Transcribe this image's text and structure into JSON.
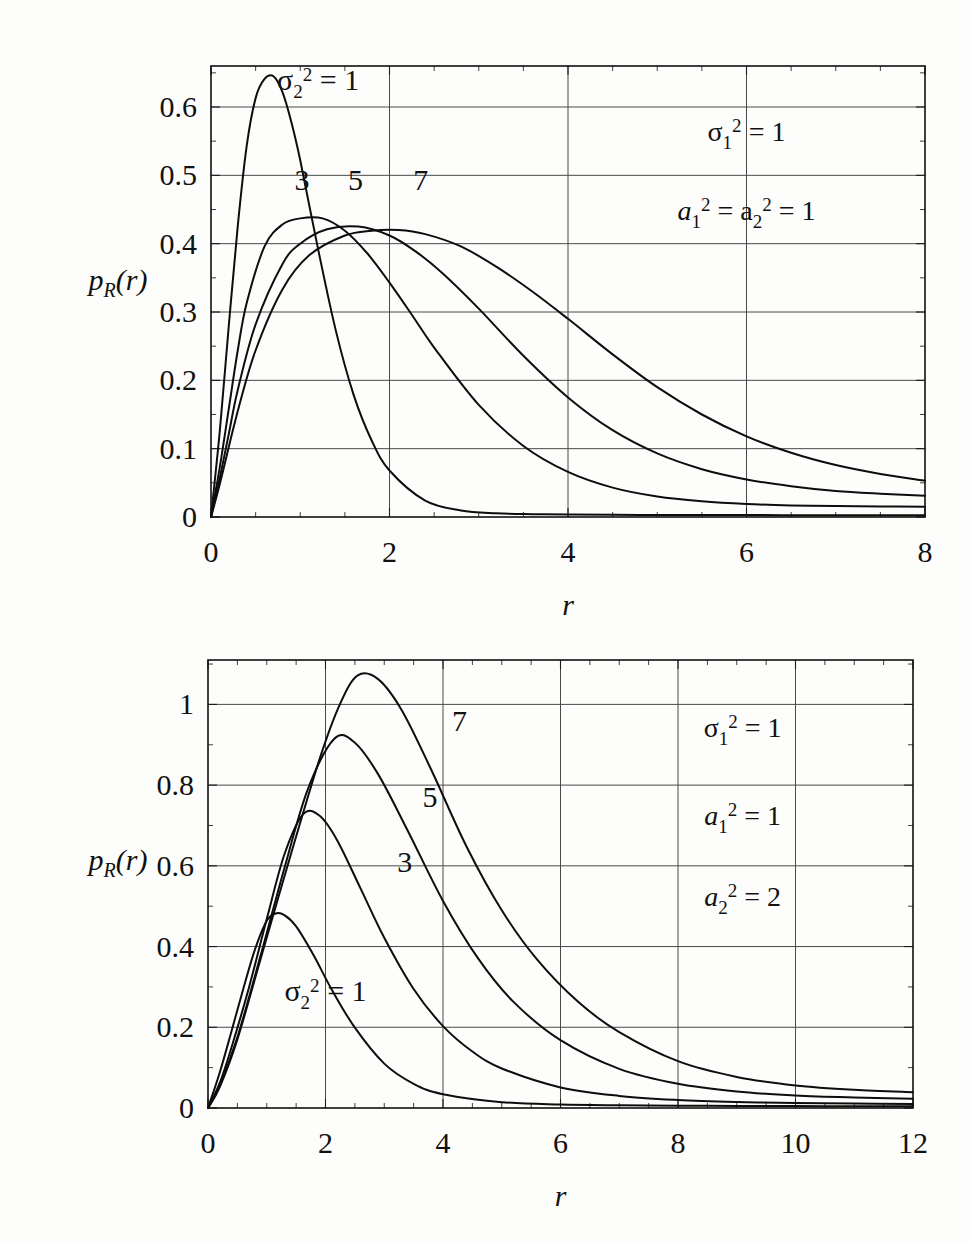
{
  "chart_data": [
    {
      "type": "line",
      "id": "top-chart",
      "title": "",
      "xlabel": "r",
      "ylabel": "p_R(r)",
      "xlim": [
        0,
        8
      ],
      "ylim": [
        0,
        0.66
      ],
      "xticks": [
        0,
        2,
        4,
        6,
        8
      ],
      "xticklabels": [
        "0",
        "2",
        "4",
        "6",
        "8"
      ],
      "yticks": [
        0,
        0.1,
        0.2,
        0.3,
        0.4,
        0.5,
        0.6
      ],
      "yticklabels": [
        "0",
        "0.1",
        "0.2",
        "0.3",
        "0.4",
        "0.5",
        "0.6"
      ],
      "x_minor_step": 0.5,
      "y_minor_step": 0.05,
      "grid": true,
      "legend_position": "inline-curve-labels",
      "annotations": [
        {
          "id": "sigma1",
          "text": "σ₁² = 1",
          "x": 6.0,
          "y": 0.55
        },
        {
          "id": "a1a2",
          "text": "a₁² = a₂² = 1",
          "x": 6.0,
          "y": 0.435
        }
      ],
      "series": [
        {
          "name": "σ₂² = 1",
          "label": "σ₂² = 1",
          "label_x": 1.2,
          "label_y": 0.625,
          "peak_x": 0.7,
          "peak_y": 0.645,
          "x": [
            0,
            0.1,
            0.2,
            0.3,
            0.4,
            0.5,
            0.6,
            0.7,
            0.8,
            0.9,
            1.0,
            1.2,
            1.4,
            1.6,
            1.8,
            2.0,
            2.4,
            2.8,
            3.2,
            3.6,
            4.0,
            4.8,
            5.6,
            6.4,
            7.2,
            8.0
          ],
          "y": [
            0.0,
            0.128,
            0.281,
            0.426,
            0.543,
            0.613,
            0.641,
            0.645,
            0.622,
            0.578,
            0.522,
            0.392,
            0.272,
            0.178,
            0.112,
            0.068,
            0.024,
            0.0095,
            0.0055,
            0.0042,
            0.0036,
            0.0031,
            0.0029,
            0.0027,
            0.0026,
            0.0025
          ]
        },
        {
          "name": "3",
          "label": "3",
          "label_x": 1.02,
          "label_y": 0.478,
          "peak_x": 1.25,
          "peak_y": 0.437,
          "x": [
            0,
            0.1,
            0.2,
            0.3,
            0.4,
            0.6,
            0.8,
            1.0,
            1.25,
            1.5,
            1.75,
            2.0,
            2.25,
            2.5,
            3.0,
            3.5,
            4.0,
            4.5,
            5.0,
            5.5,
            6.0,
            6.5,
            7.0,
            7.5,
            8.0
          ],
          "y": [
            0.0,
            0.074,
            0.159,
            0.244,
            0.313,
            0.396,
            0.428,
            0.437,
            0.437,
            0.419,
            0.386,
            0.343,
            0.296,
            0.248,
            0.164,
            0.104,
            0.066,
            0.043,
            0.03,
            0.023,
            0.019,
            0.017,
            0.016,
            0.0155,
            0.015
          ]
        },
        {
          "name": "5",
          "label": "5",
          "label_x": 1.62,
          "label_y": 0.478,
          "peak_x": 1.65,
          "peak_y": 0.425,
          "x": [
            0,
            0.1,
            0.2,
            0.3,
            0.5,
            0.8,
            1.0,
            1.3,
            1.65,
            2.0,
            2.3,
            2.6,
            3.0,
            3.5,
            4.0,
            4.5,
            5.0,
            5.5,
            6.0,
            6.5,
            7.0,
            7.5,
            8.0
          ],
          "y": [
            0.0,
            0.058,
            0.122,
            0.186,
            0.282,
            0.37,
            0.4,
            0.421,
            0.425,
            0.412,
            0.388,
            0.356,
            0.305,
            0.236,
            0.175,
            0.127,
            0.093,
            0.07,
            0.055,
            0.045,
            0.038,
            0.034,
            0.031
          ]
        },
        {
          "name": "7",
          "label": "7",
          "label_x": 2.35,
          "label_y": 0.478,
          "peak_x": 2.1,
          "peak_y": 0.42,
          "x": [
            0,
            0.1,
            0.3,
            0.5,
            0.8,
            1.1,
            1.5,
            1.8,
            2.1,
            2.4,
            2.8,
            3.2,
            3.6,
            4.0,
            4.5,
            5.0,
            5.5,
            6.0,
            6.5,
            7.0,
            7.5,
            8.0
          ],
          "y": [
            0.0,
            0.049,
            0.155,
            0.244,
            0.333,
            0.383,
            0.412,
            0.419,
            0.42,
            0.414,
            0.396,
            0.366,
            0.33,
            0.29,
            0.238,
            0.19,
            0.15,
            0.118,
            0.094,
            0.076,
            0.063,
            0.053
          ]
        }
      ]
    },
    {
      "type": "line",
      "id": "bottom-chart",
      "title": "",
      "xlabel": "r",
      "ylabel": "p_R(r)",
      "xlim": [
        0,
        12
      ],
      "ylim": [
        0,
        1.11
      ],
      "xticks": [
        0,
        2,
        4,
        6,
        8,
        10,
        12
      ],
      "xticklabels": [
        "0",
        "2",
        "4",
        "6",
        "8",
        "10",
        "12"
      ],
      "yticks": [
        0,
        0.2,
        0.4,
        0.6,
        0.8,
        1.0
      ],
      "yticklabels": [
        "0",
        "0.2",
        "0.4",
        "0.6",
        "0.8",
        "1"
      ],
      "x_minor_step": 0.5,
      "y_minor_step": 0.1,
      "grid": true,
      "legend_position": "inline-curve-labels",
      "annotations": [
        {
          "id": "sigma1",
          "text": "σ₁² = 1",
          "x": 9.1,
          "y": 0.92
        },
        {
          "id": "a1",
          "text": "a₁² = 1",
          "x": 9.1,
          "y": 0.7
        },
        {
          "id": "a2",
          "text": "a₂² = 2",
          "x": 9.1,
          "y": 0.5
        }
      ],
      "series": [
        {
          "name": "σ₂² = 1",
          "label": "σ₂² = 1",
          "label_x": 2.0,
          "label_y": 0.265,
          "peak_x": 1.15,
          "peak_y": 0.482,
          "x": [
            0,
            0.2,
            0.4,
            0.6,
            0.8,
            1.0,
            1.15,
            1.3,
            1.5,
            1.8,
            2.1,
            2.5,
            3.0,
            3.5,
            4.0,
            5.0,
            6.0,
            7.0,
            8.0,
            9.0,
            10.0,
            11.0,
            12.0
          ],
          "y": [
            0.0,
            0.088,
            0.19,
            0.295,
            0.393,
            0.464,
            0.482,
            0.478,
            0.45,
            0.378,
            0.295,
            0.199,
            0.11,
            0.06,
            0.034,
            0.0145,
            0.0088,
            0.0068,
            0.0058,
            0.0052,
            0.0048,
            0.0045,
            0.0043
          ]
        },
        {
          "name": "3",
          "label": "3",
          "label_x": 3.35,
          "label_y": 0.585,
          "peak_x": 1.62,
          "peak_y": 0.728,
          "x": [
            0,
            0.2,
            0.4,
            0.7,
            1.0,
            1.3,
            1.62,
            1.9,
            2.2,
            2.6,
            3.0,
            3.5,
            4.0,
            4.5,
            5.0,
            6.0,
            7.0,
            8.0,
            9.0,
            10.0,
            11.0,
            12.0
          ],
          "y": [
            0.0,
            0.062,
            0.15,
            0.3,
            0.468,
            0.628,
            0.728,
            0.724,
            0.663,
            0.543,
            0.422,
            0.295,
            0.203,
            0.14,
            0.098,
            0.051,
            0.03,
            0.02,
            0.015,
            0.0125,
            0.011,
            0.01
          ]
        },
        {
          "name": "5",
          "label": "5",
          "label_x": 3.78,
          "label_y": 0.745,
          "peak_x": 2.15,
          "peak_y": 0.915,
          "x": [
            0,
            0.2,
            0.5,
            0.9,
            1.3,
            1.7,
            2.15,
            2.5,
            2.9,
            3.4,
            4.0,
            4.6,
            5.2,
            6.0,
            7.0,
            8.0,
            9.0,
            10.0,
            11.0,
            12.0
          ],
          "y": [
            0.0,
            0.055,
            0.175,
            0.38,
            0.594,
            0.79,
            0.915,
            0.905,
            0.826,
            0.687,
            0.513,
            0.37,
            0.263,
            0.168,
            0.097,
            0.06,
            0.041,
            0.031,
            0.026,
            0.023
          ]
        },
        {
          "name": "7",
          "label": "7",
          "label_x": 4.28,
          "label_y": 0.935,
          "peak_x": 2.55,
          "peak_y": 1.072,
          "x": [
            0,
            0.2,
            0.5,
            0.9,
            1.4,
            1.9,
            2.25,
            2.55,
            2.9,
            3.3,
            3.8,
            4.4,
            5.0,
            5.6,
            6.3,
            7.0,
            8.0,
            9.0,
            10.0,
            11.0,
            12.0
          ],
          "y": [
            0.0,
            0.052,
            0.17,
            0.372,
            0.623,
            0.865,
            1.002,
            1.072,
            1.062,
            0.985,
            0.838,
            0.648,
            0.49,
            0.368,
            0.263,
            0.188,
            0.116,
            0.077,
            0.056,
            0.045,
            0.039
          ]
        }
      ]
    }
  ],
  "figures": {
    "top": {
      "name": "top-plot",
      "ylabel_parts": {
        "p": "p",
        "sub": "R",
        "open": "(",
        "r": "r",
        "close": ")"
      },
      "xlabel": "r"
    },
    "bottom": {
      "name": "bottom-plot",
      "ylabel_parts": {
        "p": "p",
        "sub": "R",
        "open": "(",
        "r": "r",
        "close": ")"
      },
      "xlabel": "r"
    }
  },
  "colors": {
    "background": "#fdfdfb",
    "ink": "#101010",
    "grid": "#4a4a4a"
  }
}
